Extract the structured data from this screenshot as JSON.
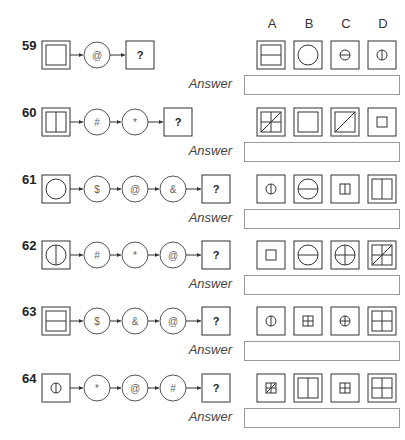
{
  "header": {
    "options": [
      "A",
      "B",
      "C",
      "D"
    ]
  },
  "answer_label": "Answer",
  "unknown_glyph": "?",
  "questions": [
    {
      "number": "59",
      "start": "square-in-square",
      "ops": [
        "@"
      ],
      "options": [
        "square-horizontal-split",
        "circle-large",
        "circle-small-horizontal-line",
        "circle-small-vertical-line"
      ],
      "answer": ""
    },
    {
      "number": "60",
      "start": "square-vertical-split",
      "ops": [
        "#",
        "*"
      ],
      "options": [
        "square-cross-diagonal",
        "square-in-square",
        "square-diagonal",
        "small-square"
      ],
      "answer": ""
    },
    {
      "number": "61",
      "start": "circle-in-square",
      "ops": [
        "$",
        "@",
        "&"
      ],
      "options": [
        "circle-small-vertical-line",
        "circle-large-horizontal-line",
        "small-square-vertical-split",
        "square-vertical-split"
      ],
      "answer": ""
    },
    {
      "number": "62",
      "start": "circle-vertical-line",
      "ops": [
        "#",
        "*",
        "@"
      ],
      "options": [
        "small-square",
        "circle-large-horizontal-line",
        "circle-cross",
        "square-cross-diagonal"
      ],
      "answer": ""
    },
    {
      "number": "63",
      "start": "square-horizontal-split",
      "ops": [
        "$",
        "&",
        "@"
      ],
      "options": [
        "circle-small-vertical-line",
        "small-square-cross",
        "circle-small-cross",
        "square-cross"
      ],
      "answer": ""
    },
    {
      "number": "64",
      "start": "circle-small-vertical-line",
      "ops": [
        "*",
        "@",
        "#"
      ],
      "options": [
        "small-square-cross-diagonal",
        "square-vertical-split",
        "small-square-cross",
        "square-cross"
      ],
      "answer": ""
    }
  ]
}
